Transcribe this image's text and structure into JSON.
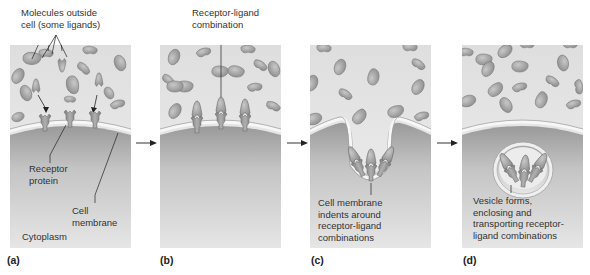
{
  "figure": {
    "panels": [
      {
        "id": "a",
        "label": "(a)",
        "callouts": {
          "molecules": [
            "Molecules outside",
            "cell (some ligands)"
          ],
          "receptor": [
            "Receptor",
            "protein"
          ],
          "membrane": [
            "Cell",
            "membrane"
          ],
          "cytoplasm": "Cytoplasm"
        }
      },
      {
        "id": "b",
        "label": "(b)",
        "callouts": {
          "combination": [
            "Receptor-ligand",
            "combination"
          ]
        }
      },
      {
        "id": "c",
        "label": "(c)",
        "callouts": {
          "indent": [
            "Cell membrane",
            "indents around",
            "receptor-ligand",
            "combinations"
          ]
        }
      },
      {
        "id": "d",
        "label": "(d)",
        "callouts": {
          "vesicle": [
            "Vesicle forms,",
            "enclosing and",
            "transporting receptor-",
            "ligand combinations"
          ]
        }
      }
    ],
    "colors": {
      "extracellular": "#e9e9e9",
      "cytoplasm_top": "#9a9a9a",
      "cytoplasm_bottom": "#e4e4e4",
      "molecule": "#a9a9a9",
      "molecule_edge": "#7a7a7a",
      "membrane": "#f4f4f4",
      "receptor": "#8c8c8c",
      "text": "#333333"
    }
  }
}
